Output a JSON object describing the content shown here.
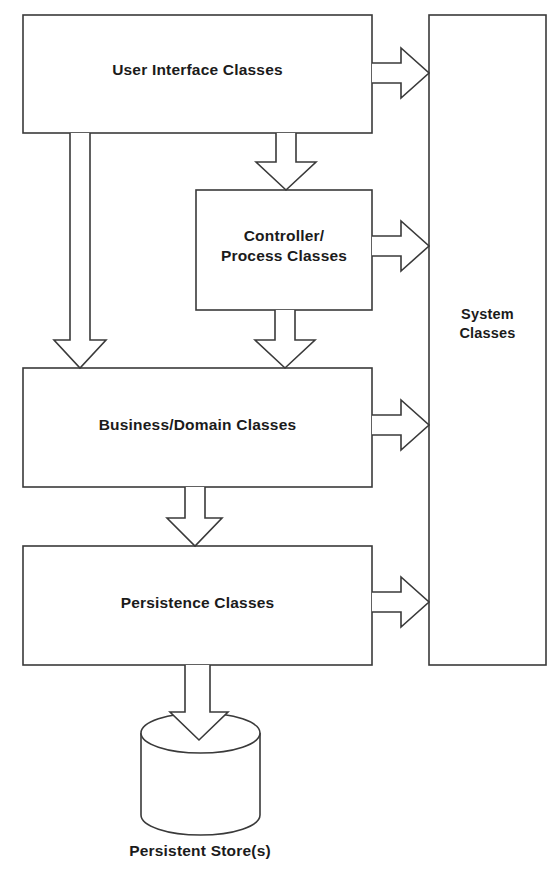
{
  "diagram": {
    "type": "layered-block-diagram",
    "stroke_color": "#3a3a3a",
    "text_color": "#1b1b1b",
    "background_color": "#ffffff",
    "nodes": [
      {
        "id": "user-interface-classes",
        "label": "User Interface Classes",
        "shape": "rectangle",
        "x": 23,
        "y": 15,
        "width": 349,
        "height": 118
      },
      {
        "id": "controller-process-classes",
        "label": "Controller/\nProcess Classes",
        "shape": "rectangle",
        "x": 196,
        "y": 190,
        "width": 176,
        "height": 120
      },
      {
        "id": "business-domain-classes",
        "label": "Business/Domain Classes",
        "shape": "rectangle",
        "x": 23,
        "y": 368,
        "width": 349,
        "height": 119
      },
      {
        "id": "persistence-classes",
        "label": "Persistence Classes",
        "shape": "rectangle",
        "x": 23,
        "y": 546,
        "width": 349,
        "height": 119
      },
      {
        "id": "system-classes",
        "label": "System\nClasses",
        "shape": "rectangle",
        "x": 429,
        "y": 15,
        "width": 117,
        "height": 650
      },
      {
        "id": "persistent-store",
        "label": "Persistent Store(s)",
        "shape": "cylinder",
        "x": 141,
        "y": 717,
        "width": 119,
        "height": 118
      }
    ],
    "edges": [
      {
        "from": "user-interface-classes",
        "to": "system-classes",
        "direction": "right",
        "style": "hollow-block-arrow"
      },
      {
        "from": "user-interface-classes",
        "to": "controller-process-classes",
        "direction": "down",
        "style": "hollow-block-arrow"
      },
      {
        "from": "user-interface-classes",
        "to": "business-domain-classes",
        "direction": "down",
        "style": "hollow-block-arrow"
      },
      {
        "from": "controller-process-classes",
        "to": "system-classes",
        "direction": "right",
        "style": "hollow-block-arrow"
      },
      {
        "from": "controller-process-classes",
        "to": "business-domain-classes",
        "direction": "down",
        "style": "hollow-block-arrow"
      },
      {
        "from": "business-domain-classes",
        "to": "system-classes",
        "direction": "right",
        "style": "hollow-block-arrow"
      },
      {
        "from": "business-domain-classes",
        "to": "persistence-classes",
        "direction": "down",
        "style": "hollow-block-arrow"
      },
      {
        "from": "persistence-classes",
        "to": "system-classes",
        "direction": "right",
        "style": "hollow-block-arrow"
      },
      {
        "from": "persistence-classes",
        "to": "persistent-store",
        "direction": "down",
        "style": "hollow-block-arrow"
      }
    ]
  }
}
